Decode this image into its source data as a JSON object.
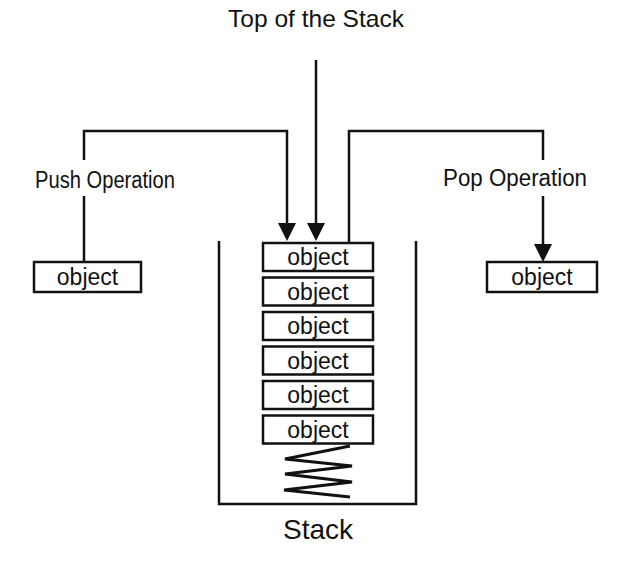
{
  "diagram": {
    "title": "Top of the Stack",
    "push_label": "Push Operation",
    "pop_label": "Pop Operation",
    "stack_label": "Stack",
    "push_object": "object",
    "pop_object": "object",
    "stack_items": [
      "object",
      "object",
      "object",
      "object",
      "object",
      "object"
    ],
    "colors": {
      "stroke": "#111111",
      "background": "#ffffff"
    }
  }
}
